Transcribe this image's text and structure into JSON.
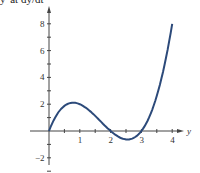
{
  "caption": "y' at  dy/dt",
  "chart_data": {
    "type": "line",
    "title": "",
    "xlabel": "y",
    "ylabel": "",
    "xlim": [
      0,
      4
    ],
    "ylim": [
      -3,
      9
    ],
    "x_ticks": [
      1,
      2,
      3,
      4
    ],
    "y_ticks": [
      -2,
      2,
      4,
      6,
      8
    ],
    "grid": false,
    "series": [
      {
        "name": "f(y) = y(y-2)(y-3)",
        "x": [
          0,
          0.25,
          0.5,
          0.78,
          1,
          1.25,
          1.5,
          1.75,
          2,
          2.25,
          2.55,
          2.75,
          3,
          3.25,
          3.5,
          3.75,
          4
        ],
        "y": [
          0,
          1.23,
          1.88,
          2.11,
          2.0,
          1.64,
          1.13,
          0.55,
          0,
          -0.42,
          -0.63,
          -0.52,
          0,
          0.99,
          2.63,
          4.45,
          8.0
        ]
      }
    ],
    "color": "#2c4a7a"
  }
}
